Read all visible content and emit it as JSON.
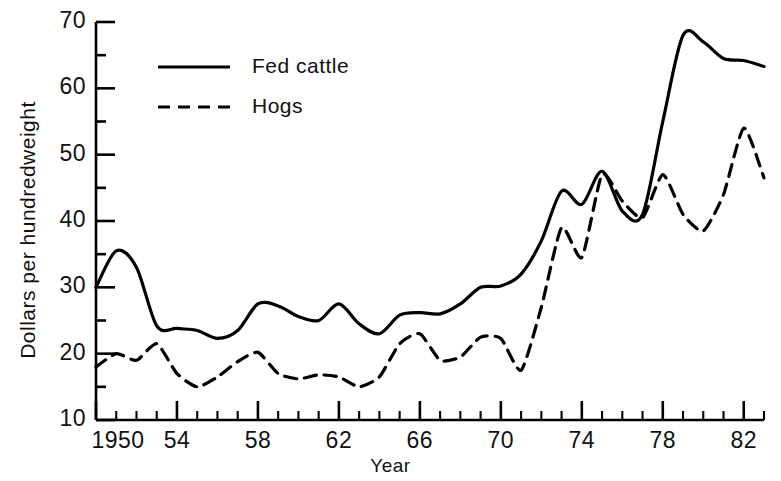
{
  "chart_data": {
    "type": "line",
    "title": "",
    "xlabel": "Year",
    "ylabel": "Dollars per hundredweight",
    "xlim": [
      1950,
      1983
    ],
    "ylim": [
      10,
      70
    ],
    "y_major_ticks": [
      10,
      20,
      30,
      40,
      50,
      60,
      70
    ],
    "y_minor_ticks": [
      15,
      25,
      35,
      45,
      55,
      65
    ],
    "y_tick_labels": [
      "10",
      "20",
      "30",
      "40",
      "50",
      "60",
      "70"
    ],
    "x_major_ticks": [
      1950,
      1954,
      1958,
      1962,
      1966,
      1970,
      1974,
      1978,
      1982
    ],
    "x_tick_labels": [
      "1950",
      "54",
      "58",
      "62",
      "66",
      "70",
      "74",
      "78",
      "82"
    ],
    "grid": false,
    "legend_position": "upper-left",
    "x": [
      1950,
      1951,
      1952,
      1953,
      1954,
      1955,
      1956,
      1957,
      1958,
      1959,
      1960,
      1961,
      1962,
      1963,
      1964,
      1965,
      1966,
      1967,
      1968,
      1969,
      1970,
      1971,
      1972,
      1973,
      1974,
      1975,
      1976,
      1977,
      1978,
      1979,
      1980,
      1981,
      1982,
      1983
    ],
    "series": [
      {
        "name": "Fed cattle",
        "style": "solid",
        "color": "#000000",
        "values": [
          30.0,
          35.5,
          33.0,
          24.2,
          23.8,
          23.5,
          22.3,
          23.5,
          27.5,
          27.2,
          25.6,
          25.0,
          27.5,
          24.5,
          23.0,
          25.8,
          26.2,
          26.0,
          27.5,
          30.0,
          30.2,
          32.0,
          37.0,
          44.5,
          42.5,
          47.5,
          41.5,
          41.0,
          55.0,
          68.0,
          67.0,
          64.5,
          64.2,
          63.3
        ]
      },
      {
        "name": "Hogs",
        "style": "dashed",
        "color": "#000000",
        "values": [
          18.0,
          20.0,
          19.0,
          21.5,
          17.0,
          15.0,
          16.5,
          18.8,
          20.2,
          17.0,
          16.2,
          16.8,
          16.5,
          15.0,
          16.5,
          21.5,
          23.0,
          19.0,
          19.5,
          22.5,
          22.3,
          17.5,
          27.0,
          39.0,
          34.5,
          47.0,
          43.0,
          40.5,
          47.0,
          41.0,
          38.5,
          44.0,
          54.0,
          46.5
        ]
      }
    ]
  },
  "legend": {
    "items": [
      {
        "label": "Fed cattle",
        "style": "solid"
      },
      {
        "label": "Hogs",
        "style": "dashed"
      }
    ]
  }
}
